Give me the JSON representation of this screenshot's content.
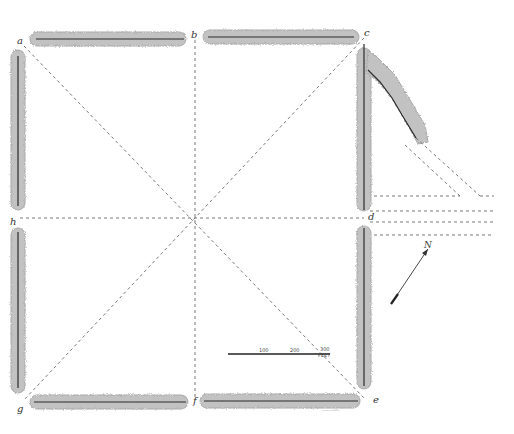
{
  "diagram": {
    "type": "earthwork-plan",
    "corner_labels": {
      "a": "a",
      "b": "b",
      "c": "c",
      "d": "d",
      "e": "e",
      "f": "f",
      "g": "g",
      "h": "h"
    },
    "scale_bar": {
      "mark_1": "100",
      "mark_2": "200",
      "mark_3": "300",
      "unit": "FEET"
    },
    "north_arrow": {
      "label": "N"
    },
    "engraver_credit": "···········"
  },
  "colors": {
    "paper": "#ffffff",
    "embankment": "#b9b9b9",
    "line": "#2b2b2b",
    "dashed": "#555555"
  }
}
